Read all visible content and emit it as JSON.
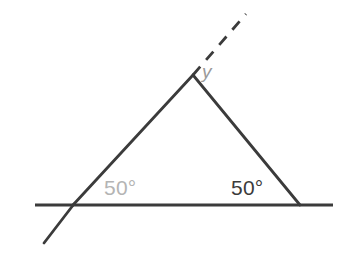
{
  "figure": {
    "background_color": "#ffffff",
    "width": 350,
    "height": 254,
    "stroke_color": "#3b3b3b",
    "stroke_width": 2.6
  },
  "labels": {
    "left_angle": {
      "text": "50°",
      "value": 50,
      "unit": "degrees",
      "color": "#b4b4b4",
      "x": 104,
      "y": 176
    },
    "right_angle": {
      "text": "50°",
      "value": 50,
      "unit": "degrees",
      "color": "#3b3b3b",
      "x": 231,
      "y": 176
    },
    "apex_angle": {
      "text": "y",
      "color": "#9a9a9a",
      "x": 202,
      "y": 61
    }
  },
  "geometry": {
    "points": {
      "left_vertex": {
        "x": 73,
        "y": 205
      },
      "right_vertex": {
        "x": 300,
        "y": 205
      },
      "apex": {
        "x": 193,
        "y": 75
      },
      "baseline_left_end": {
        "x": 35,
        "y": 205
      },
      "baseline_right_end": {
        "x": 333,
        "y": 205
      },
      "transversal_tail_end": {
        "x": 44,
        "y": 243
      },
      "dashed_ray_end": {
        "x": 246,
        "y": 14
      }
    },
    "segments": [
      {
        "name": "baseline",
        "x1": 35,
        "y1": 205,
        "x2": 333,
        "y2": 205,
        "style": "solid"
      },
      {
        "name": "left-side",
        "x1": 73,
        "y1": 205,
        "x2": 193,
        "y2": 75,
        "style": "solid"
      },
      {
        "name": "right-side",
        "x1": 193,
        "y1": 75,
        "x2": 300,
        "y2": 205,
        "style": "solid"
      },
      {
        "name": "transversal-tail",
        "x1": 73,
        "y1": 205,
        "x2": 44,
        "y2": 243,
        "style": "solid"
      },
      {
        "name": "dashed-ray",
        "x1": 193,
        "y1": 75,
        "x2": 246,
        "y2": 14,
        "style": "dashed"
      }
    ],
    "dash_pattern": "11 9"
  }
}
